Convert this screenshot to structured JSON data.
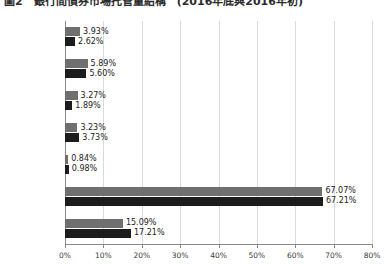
{
  "title": "圖2　銀行間債券市場托管量結構　(2016年底與2016年初)",
  "chart_data": {
    "type": "bar",
    "orientation": "horizontal",
    "title": "圖2　銀行間債券市場托管量結構　(2016年底與2016年初)",
    "xlabel": "",
    "ylabel": "",
    "xlim": [
      0,
      80
    ],
    "xunit": "%",
    "grid": true,
    "legend": "none",
    "categories": [
      "境外機構",
      "交易所投資者",
      "基金",
      "保險機構",
      "信用社",
      "商業銀行",
      "特殊結算成員"
    ],
    "tick_labels": [
      "0%",
      "10%",
      "20%",
      "30%",
      "40%",
      "50%",
      "60%",
      "70%",
      "80%"
    ],
    "tick_values": [
      0,
      10,
      20,
      30,
      40,
      50,
      60,
      70,
      80
    ],
    "series": [
      {
        "name": "series-1",
        "color": "#6f6f6f",
        "values": [
          3.93,
          5.89,
          3.27,
          3.23,
          0.84,
          67.07,
          15.09
        ],
        "labels": [
          "3.93%",
          "5.89%",
          "3.27%",
          "3.23%",
          "0.84%",
          "67.07%",
          "15.09%"
        ]
      },
      {
        "name": "series-2",
        "color": "#1c1c1c",
        "values": [
          2.62,
          5.6,
          1.89,
          3.73,
          0.98,
          67.21,
          17.21
        ],
        "labels": [
          "2.62%",
          "5.60%",
          "1.89%",
          "3.73%",
          "0.98%",
          "67.21%",
          "17.21%"
        ]
      }
    ]
  },
  "colors": {
    "series1": "#6f6f6f",
    "series2": "#1c1c1c",
    "grid": "#d9d9d9",
    "axis": "#8a8a8a",
    "background": "#ffffff"
  }
}
